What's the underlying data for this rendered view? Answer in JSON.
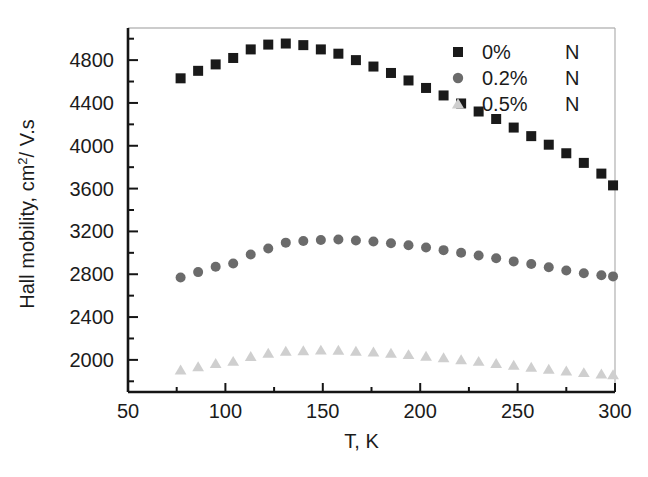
{
  "chart_data": {
    "type": "scatter",
    "title": "",
    "xlabel": "T, K",
    "ylabel": "Hall mobility, cm2/ V.s",
    "ylabel_parts": {
      "pre": "Hall mobility, cm",
      "sup": "2",
      "post": "/ V.s"
    },
    "xlim": [
      50,
      300
    ],
    "ylim": [
      1700,
      5100
    ],
    "xticks": [
      50,
      100,
      150,
      200,
      250,
      300
    ],
    "xticklabels": [
      "50",
      "100",
      "150",
      "200",
      "250",
      "300"
    ],
    "yticks": [
      2000,
      2400,
      2800,
      3200,
      3600,
      4000,
      4400,
      4800
    ],
    "yticklabels": [
      "2000",
      "2400",
      "2800",
      "3200",
      "3600",
      "4000",
      "4400",
      "4800"
    ],
    "x_minor_step": 25,
    "y_minor_step": 200,
    "grid": false,
    "legend_position": "top-right",
    "series": [
      {
        "name": "0%",
        "suffix": "N",
        "marker": "square",
        "color": "#1a1a1a",
        "x": [
          77,
          86,
          95,
          104,
          113,
          122,
          131,
          140,
          149,
          158,
          167,
          176,
          185,
          194,
          203,
          212,
          221,
          230,
          239,
          248,
          257,
          266,
          275,
          284,
          293,
          299
        ],
        "y": [
          4630,
          4700,
          4760,
          4820,
          4900,
          4945,
          4955,
          4940,
          4900,
          4860,
          4800,
          4740,
          4680,
          4610,
          4540,
          4470,
          4395,
          4320,
          4250,
          4170,
          4090,
          4010,
          3930,
          3840,
          3740,
          3630
        ]
      },
      {
        "name": "0.2%",
        "suffix": "N",
        "marker": "circle",
        "color": "#6b6b6b",
        "x": [
          77,
          86,
          95,
          104,
          113,
          122,
          131,
          140,
          149,
          158,
          167,
          176,
          185,
          194,
          203,
          212,
          221,
          230,
          239,
          248,
          257,
          266,
          275,
          284,
          293,
          299
        ],
        "y": [
          2770,
          2820,
          2870,
          2900,
          2985,
          3040,
          3095,
          3110,
          3120,
          3125,
          3115,
          3105,
          3090,
          3070,
          3050,
          3025,
          3000,
          2975,
          2950,
          2920,
          2895,
          2865,
          2835,
          2810,
          2790,
          2780
        ]
      },
      {
        "name": "0.5%",
        "suffix": "N",
        "marker": "triangle",
        "color": "#cfcfcf",
        "x": [
          77,
          86,
          95,
          104,
          113,
          122,
          131,
          140,
          149,
          158,
          167,
          176,
          185,
          194,
          203,
          212,
          221,
          230,
          239,
          248,
          257,
          266,
          275,
          284,
          293,
          299
        ],
        "y": [
          1905,
          1935,
          1965,
          1985,
          2030,
          2060,
          2080,
          2085,
          2090,
          2088,
          2080,
          2072,
          2060,
          2048,
          2032,
          2018,
          2000,
          1985,
          1965,
          1948,
          1930,
          1912,
          1895,
          1880,
          1868,
          1860
        ]
      }
    ]
  },
  "legend": {
    "entries": [
      {
        "label": "0%",
        "suffix": "N"
      },
      {
        "label": "0.2%",
        "suffix": "N"
      },
      {
        "label": "0.5%",
        "suffix": "N"
      }
    ]
  }
}
